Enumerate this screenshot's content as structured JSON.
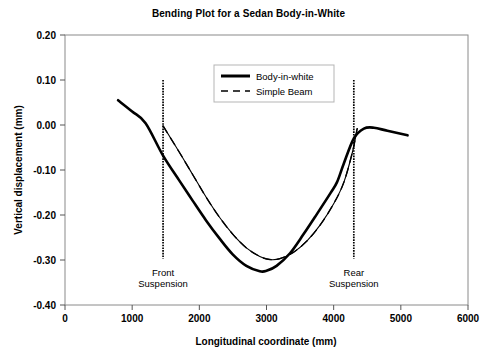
{
  "chart_data": {
    "type": "line",
    "title": "Bending Plot for a Sedan Body-in-White",
    "xlabel": "Longitudinal coordinate (mm)",
    "ylabel": "Vertical displacement (mm)",
    "xlim": [
      0,
      6000
    ],
    "ylim": [
      -0.4,
      0.2
    ],
    "xticks": [
      0,
      1000,
      2000,
      3000,
      4000,
      5000,
      6000
    ],
    "xtick_labels": [
      "0",
      "1000",
      "2000",
      "3000",
      "4000",
      "5000",
      "6000"
    ],
    "yticks": [
      0.2,
      0.1,
      0.0,
      -0.1,
      -0.2,
      -0.3,
      -0.4
    ],
    "ytick_labels": [
      "0.20",
      "0.10",
      "0.00",
      "-0.10",
      "-0.20",
      "-0.30",
      "-0.40"
    ],
    "grid": false,
    "legend_position": "top-center",
    "series": [
      {
        "name": "Body-in-white",
        "style": "solid",
        "color": "#000000",
        "width": 2.6,
        "points": [
          [
            790,
            0.055
          ],
          [
            1000,
            0.03
          ],
          [
            1200,
            0.004
          ],
          [
            1460,
            -0.068
          ],
          [
            1700,
            -0.123
          ],
          [
            1900,
            -0.168
          ],
          [
            2100,
            -0.212
          ],
          [
            2300,
            -0.252
          ],
          [
            2500,
            -0.288
          ],
          [
            2700,
            -0.313
          ],
          [
            2900,
            -0.325
          ],
          [
            3000,
            -0.324
          ],
          [
            3150,
            -0.313
          ],
          [
            3350,
            -0.285
          ],
          [
            3550,
            -0.243
          ],
          [
            3750,
            -0.198
          ],
          [
            3950,
            -0.152
          ],
          [
            4050,
            -0.127
          ],
          [
            4150,
            -0.086
          ],
          [
            4300,
            -0.03
          ],
          [
            4450,
            -0.008
          ],
          [
            4600,
            -0.006
          ],
          [
            4800,
            -0.013
          ],
          [
            5100,
            -0.023
          ]
        ]
      },
      {
        "name": "Simple Beam",
        "style": "dashed",
        "color": "#000000",
        "width": 1.4,
        "points": [
          [
            1460,
            -0.002
          ],
          [
            1700,
            -0.06
          ],
          [
            1900,
            -0.11
          ],
          [
            2100,
            -0.16
          ],
          [
            2300,
            -0.205
          ],
          [
            2500,
            -0.243
          ],
          [
            2700,
            -0.273
          ],
          [
            2900,
            -0.292
          ],
          [
            3050,
            -0.299
          ],
          [
            3200,
            -0.297
          ],
          [
            3400,
            -0.283
          ],
          [
            3600,
            -0.258
          ],
          [
            3800,
            -0.222
          ],
          [
            4000,
            -0.175
          ],
          [
            4150,
            -0.128
          ],
          [
            4280,
            -0.06
          ],
          [
            4350,
            -0.008
          ]
        ]
      },
      {
        "name": "Simple Beam Thin Overlay",
        "style": "solid",
        "color": "#000000",
        "width": 1.1,
        "points": [
          [
            1460,
            -0.002
          ],
          [
            1700,
            -0.06
          ],
          [
            1900,
            -0.11
          ],
          [
            2100,
            -0.16
          ],
          [
            2300,
            -0.205
          ],
          [
            2500,
            -0.243
          ],
          [
            2700,
            -0.273
          ],
          [
            2900,
            -0.292
          ],
          [
            3050,
            -0.299
          ],
          [
            3200,
            -0.297
          ],
          [
            3400,
            -0.283
          ],
          [
            3600,
            -0.258
          ],
          [
            3800,
            -0.222
          ],
          [
            4000,
            -0.175
          ],
          [
            4150,
            -0.128
          ],
          [
            4280,
            -0.06
          ],
          [
            4350,
            -0.008
          ]
        ]
      }
    ],
    "annotations": [
      {
        "name": "front-suspension",
        "line1": "Front",
        "line2": "Suspension",
        "x": 1460,
        "y_top": 0.1,
        "y_bottom": -0.297,
        "label_x": 1460,
        "label_y": -0.336
      },
      {
        "name": "rear-suspension",
        "line1": "Rear",
        "line2": "Suspension",
        "x": 4300,
        "y_top": 0.1,
        "y_bottom": -0.297,
        "label_x": 4300,
        "label_y": -0.336
      }
    ],
    "legend": [
      {
        "label": "Body-in-white",
        "style": "solid"
      },
      {
        "label": "Simple Beam",
        "style": "dashed"
      }
    ]
  }
}
